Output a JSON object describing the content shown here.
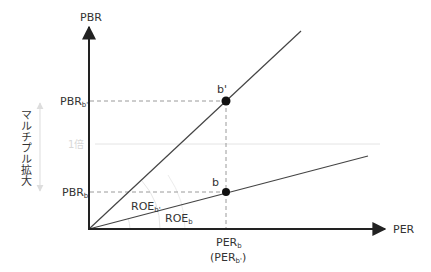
{
  "axes": {
    "y_label": "PBR",
    "x_label": "PER"
  },
  "y_ticks": [
    {
      "main": "PBR",
      "sub": "b'",
      "y": 101
    },
    {
      "main": "PBR",
      "sub": "b",
      "y": 192
    }
  ],
  "x_ticks": [
    {
      "main": "PER",
      "sub": "b",
      "x": 226
    },
    {
      "paren_open": "(",
      "main": "PER",
      "sub": "b'",
      "paren_close": ")",
      "x": 226
    }
  ],
  "points": [
    {
      "label": "b'",
      "x": 226,
      "y": 101
    },
    {
      "label": "b",
      "x": 226,
      "y": 192
    }
  ],
  "angle_labels": [
    {
      "main": "ROE",
      "sub": "b'"
    },
    {
      "main": "ROE",
      "sub": "b"
    }
  ],
  "reference_line": {
    "label": "1倍",
    "y": 144
  },
  "side_annotation": {
    "label": "マルチプル拡大"
  },
  "colors": {
    "axis": "#222222",
    "line": "#444444",
    "dashed": "#9a9a9a",
    "faint": "#d8d8d8",
    "text": "#333333",
    "point": "#111111"
  }
}
